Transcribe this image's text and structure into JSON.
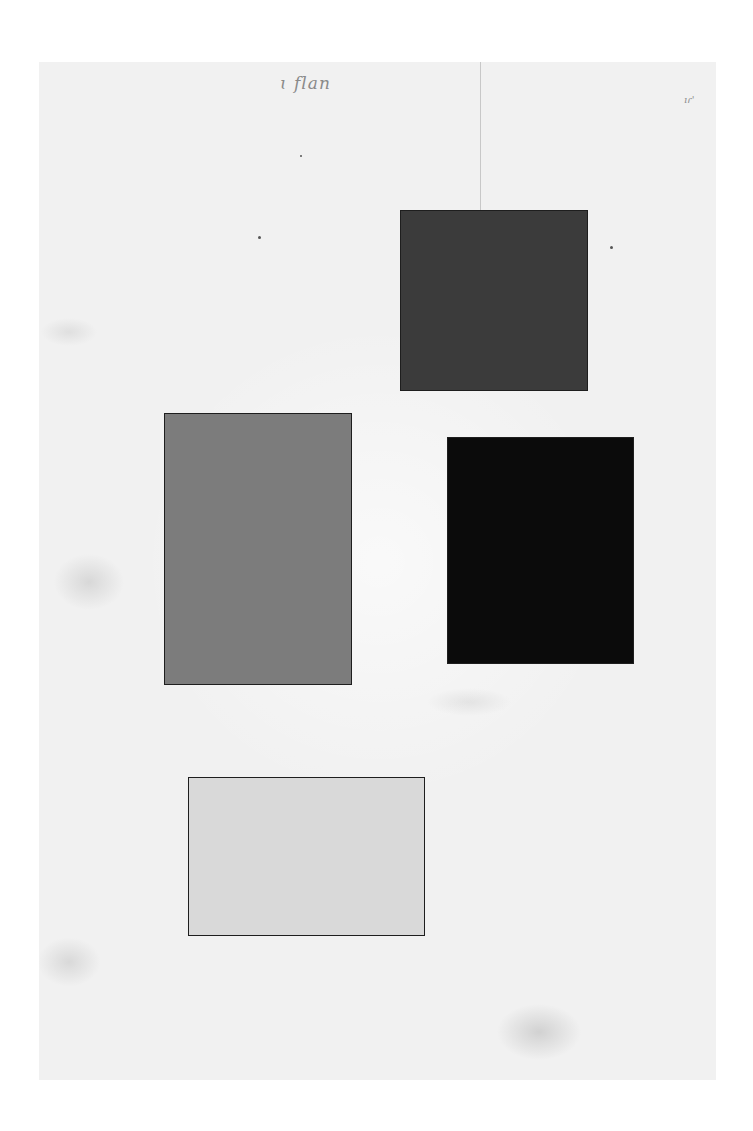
{
  "artwork": {
    "inscription_top": "ɩ flan",
    "corner_mark": "ıɾ'",
    "paper_color": "#f1f1f1",
    "rectangles": [
      {
        "name": "dark-gray-square",
        "left": 400,
        "top": 210,
        "width": 188,
        "height": 181,
        "color": "#3b3b3b"
      },
      {
        "name": "medium-gray-rectangle",
        "left": 164,
        "top": 413,
        "width": 188,
        "height": 272,
        "color": "#7c7c7c"
      },
      {
        "name": "black-rectangle",
        "left": 447,
        "top": 437,
        "width": 187,
        "height": 227,
        "color": "#0b0b0b"
      },
      {
        "name": "light-gray-rectangle",
        "left": 188,
        "top": 777,
        "width": 237,
        "height": 159,
        "color": "#d9d9d9"
      }
    ]
  }
}
